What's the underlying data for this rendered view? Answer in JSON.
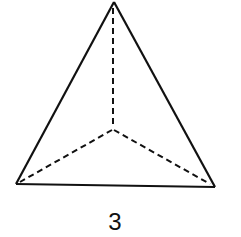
{
  "figure": {
    "label": "3",
    "shape": "tetrahedron",
    "stroke_color": "#111111",
    "vertices": {
      "apex": [
        114,
        2
      ],
      "bottom_left": [
        16,
        184
      ],
      "bottom_right": [
        215,
        187
      ],
      "hidden_center": [
        113,
        130
      ]
    },
    "visible_edges": [
      [
        "apex",
        "bottom_left"
      ],
      [
        "apex",
        "bottom_right"
      ],
      [
        "bottom_left",
        "bottom_right"
      ]
    ],
    "hidden_edges": [
      [
        "apex",
        "hidden_center"
      ],
      [
        "hidden_center",
        "bottom_left"
      ],
      [
        "hidden_center",
        "bottom_right"
      ]
    ]
  }
}
